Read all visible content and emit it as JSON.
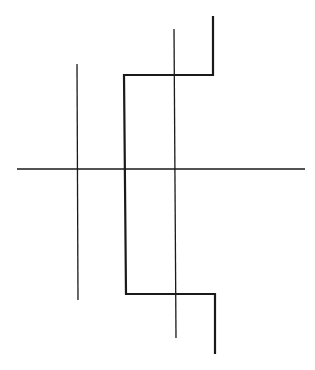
{
  "diagram": {
    "width": 315,
    "height": 370,
    "background": "#ffffff",
    "stroke_color": "#1a1a1a",
    "thin_lines": [
      {
        "name": "horizontal-axis-line",
        "x1": 17,
        "y1": 169,
        "x2": 305,
        "y2": 169,
        "width": 1.3
      },
      {
        "name": "left-vertical-line",
        "x1": 77,
        "y1": 64,
        "x2": 78,
        "y2": 300,
        "width": 1.3
      },
      {
        "name": "middle-vertical-line",
        "x1": 174,
        "y1": 29,
        "x2": 176,
        "y2": 338,
        "width": 1.3
      }
    ],
    "thick_path": {
      "name": "stepped-path",
      "points": [
        [
          213,
          16
        ],
        [
          213,
          75
        ],
        [
          124,
          75
        ],
        [
          126,
          294
        ],
        [
          215,
          294
        ],
        [
          215,
          354
        ]
      ],
      "width": 2.2
    }
  }
}
